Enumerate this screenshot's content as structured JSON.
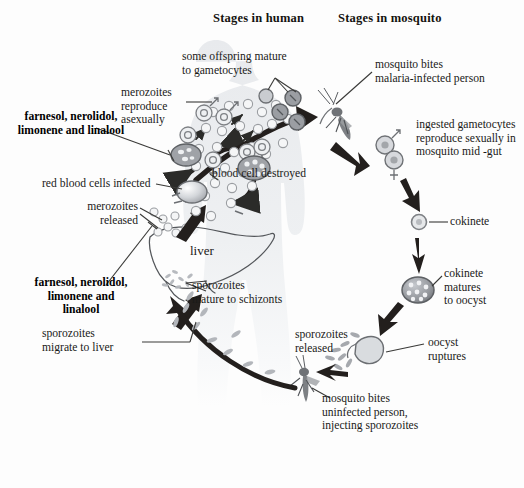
{
  "figure": {
    "headings": {
      "human": "Stages in human",
      "mosquito": "Stages in mosquito"
    }
  },
  "human_stage_labels": {
    "compounds_blood": "farnesol, nerolidol,\nlimonene and linalool",
    "compounds_liver": "farnesol, nerolidol,\nlimonene and\nlinalool",
    "merozoites_reproduce": "merozoites\nreproduce\nasexually",
    "offspring_gametocytes": "some offspring mature\nto gametocytes",
    "blood_cell_destroyed": "blood cell destroyed",
    "rbc_infected": "red blood cells infected",
    "merozoites_released": "merozoites\nreleased",
    "liver": "liver",
    "sporozoites_schizonts": "sporozoites\nmature to schizonts",
    "sporozoites_migrate": "sporozoites\nmigrate to liver"
  },
  "mosquito_stage_labels": {
    "mosquito_bites_infected": "mosquito bites\nmalaria-infected person",
    "ingested_gametocytes": "ingested gametocytes\nreproduce sexually in\nmosquito mid -gut",
    "ookinete": "cokinete",
    "ookinete_matures": "cokinete\nmatures\nto oocyst",
    "oocyst_ruptures": "oocyst\nruptures",
    "sporozoites_released": "sporozoites\nreleased",
    "mosquito_bites_uninfected": "mosquito bites\nuninfected person,\ninjecting sporozoites"
  },
  "symbols": {
    "male": "♂",
    "female": "♀"
  },
  "colors": {
    "background": "#fdfdfd",
    "silhouette": "#eceef0",
    "text": "#1a1a18",
    "arrow_dark": "#231f1d",
    "cell_outline": "#8e9094",
    "cell_fill": "#d7d9dd",
    "oocyst": "#9a9da2"
  }
}
